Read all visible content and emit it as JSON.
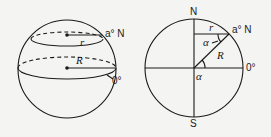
{
  "left_diagram": {
    "description": "sphere with latitude circle and equator",
    "labels": {
      "latitude": "a° N",
      "equator": "0°",
      "small_radius": "r",
      "big_radius": "R"
    }
  },
  "right_diagram": {
    "description": "cross-section circle showing latitude angle",
    "labels": {
      "north": "N",
      "south": "S",
      "latitude": "a° N",
      "equator": "0°",
      "small_radius": "r",
      "big_radius": "R",
      "angle_top": "α",
      "angle_bottom": "α"
    }
  },
  "colors": {
    "ink": "#1a1a1a",
    "background": "#f4f4f2"
  }
}
